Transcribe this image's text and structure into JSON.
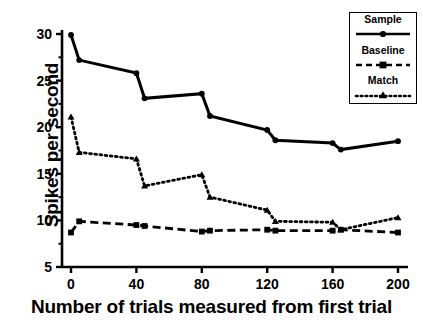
{
  "chart_data": {
    "type": "line",
    "title": "",
    "xlabel": "Number of trials measured from first trial",
    "ylabel": "Spikes per second",
    "xlim": [
      -5,
      205
    ],
    "ylim": [
      5,
      31
    ],
    "xticks": [
      0,
      40,
      80,
      120,
      160,
      200
    ],
    "yticks": [
      5,
      10,
      15,
      20,
      25,
      30
    ],
    "xtick_labels": [
      "0",
      "40",
      "80",
      "120",
      "160",
      "200"
    ],
    "ytick_labels": [
      "5",
      "10",
      "15",
      "20",
      "25",
      "30"
    ],
    "y_minor_ticks": [
      7.5,
      12.5,
      17.5,
      22.5,
      27.5
    ],
    "grid": false,
    "legend_position": "top-right",
    "series": [
      {
        "name": "Sample",
        "line_style": "solid",
        "marker": "circle",
        "color": "#000000",
        "x": [
          0,
          5,
          40,
          45,
          80,
          85,
          120,
          125,
          160,
          165,
          200
        ],
        "values": [
          29.9,
          27.2,
          25.8,
          23.1,
          23.6,
          21.2,
          19.7,
          18.6,
          18.3,
          17.6,
          18.5
        ]
      },
      {
        "name": "Baseline",
        "line_style": "dashed",
        "marker": "square",
        "color": "#000000",
        "x": [
          0,
          5,
          40,
          45,
          80,
          85,
          120,
          125,
          160,
          165,
          200
        ],
        "values": [
          8.7,
          9.9,
          9.5,
          9.4,
          8.8,
          8.9,
          9.0,
          8.9,
          8.9,
          9.0,
          8.7
        ]
      },
      {
        "name": "Match",
        "line_style": "dotted",
        "marker": "triangle",
        "color": "#000000",
        "x": [
          0,
          5,
          40,
          45,
          80,
          85,
          120,
          125,
          160,
          165,
          200
        ],
        "values": [
          21.1,
          17.3,
          16.6,
          13.7,
          14.9,
          12.5,
          11.1,
          9.9,
          9.8,
          9.0,
          10.3
        ]
      }
    ]
  },
  "legend": {
    "entries": [
      {
        "label": "Sample"
      },
      {
        "label": "Baseline"
      },
      {
        "label": "Match"
      }
    ]
  },
  "caption": {
    "fragment": ""
  }
}
